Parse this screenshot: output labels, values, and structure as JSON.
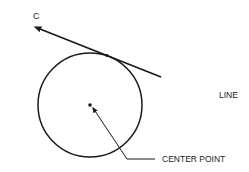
{
  "figure": {
    "corner_label": "C",
    "labels": {
      "line": "LINE",
      "center_point": "CENTER POINT"
    },
    "colors": {
      "stroke": "#1a1a1a",
      "background": "#ffffff"
    },
    "geometry": {
      "circle": {
        "cx": 90,
        "cy": 105,
        "r": 52
      },
      "tangent_line": {
        "x1": 38,
        "y1": 28,
        "x2": 160,
        "y2": 77,
        "tangent_point": [
          107,
          55
        ]
      },
      "leader": {
        "from": [
          94,
          110
        ],
        "bend": [
          127,
          159
        ],
        "to": [
          155,
          159
        ]
      }
    }
  }
}
